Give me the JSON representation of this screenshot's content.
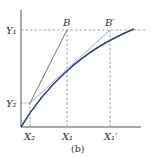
{
  "figure": {
    "caption": "(b)",
    "labels": {
      "y1": "Y₁",
      "y2": "Y₂",
      "x1": "X₁",
      "x2": "X₂",
      "x1_prime": "X₁′",
      "point_b": "B",
      "point_b_prime": "B′"
    },
    "colors": {
      "axis": "#555555",
      "curve": "#2c3e7a",
      "chord_b": "#666666",
      "chord_b_prime": "#9aa0b8",
      "dashed": "#8a8a8a",
      "text": "#333333"
    }
  }
}
